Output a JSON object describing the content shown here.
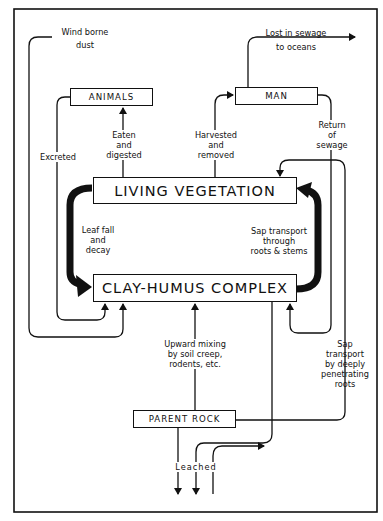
{
  "diagram": {
    "type": "nutrient-cycle flow diagram",
    "nodes": {
      "animals": "ANIMALS",
      "man": "MAN",
      "living_vegetation": "LIVING  VEGETATION",
      "clay_humus": "CLAY-HUMUS  COMPLEX",
      "parent_rock": "PARENT  ROCK"
    },
    "labels": {
      "wind": "Wind borne\ndust",
      "sewage_lost": "Lost in sewage\nto oceans",
      "excreted": "Excreted",
      "eaten": "Eaten\nand\ndigested",
      "harvested": "Harvested\nand\nremoved",
      "return_sewage": "Return\nof\nsewage",
      "leaf_fall": "Leaf fall\nand\ndecay",
      "sap_transport": "Sap transport\nthrough\nroots & stems",
      "upward_mixing": "Upward mixing\nby soil creep,\nrodents, etc.",
      "deep_sap": "Sap\ntransport\nby deeply\npenetrating\nroots",
      "leached": "Leached"
    },
    "edges": [
      {
        "from": "wind borne dust",
        "to": "CLAY-HUMUS COMPLEX"
      },
      {
        "from": "ANIMALS",
        "to": "CLAY-HUMUS COMPLEX",
        "label": "Excreted"
      },
      {
        "from": "LIVING VEGETATION",
        "to": "ANIMALS",
        "label": "Eaten and digested"
      },
      {
        "from": "LIVING VEGETATION",
        "to": "MAN",
        "label": "Harvested and removed"
      },
      {
        "from": "MAN",
        "to": "oceans",
        "label": "Lost in sewage to oceans"
      },
      {
        "from": "MAN",
        "to": "CLAY-HUMUS COMPLEX",
        "label": "Return of sewage"
      },
      {
        "from": "LIVING VEGETATION",
        "to": "CLAY-HUMUS COMPLEX",
        "label": "Leaf fall and decay"
      },
      {
        "from": "CLAY-HUMUS COMPLEX",
        "to": "LIVING VEGETATION",
        "label": "Sap transport through roots & stems"
      },
      {
        "from": "PARENT ROCK",
        "to": "CLAY-HUMUS COMPLEX",
        "label": "Upward mixing by soil creep, rodents, etc."
      },
      {
        "from": "PARENT ROCK",
        "to": "LIVING VEGETATION",
        "label": "Sap transport by deeply penetrating roots"
      },
      {
        "from": "PARENT ROCK / CLAY-HUMUS COMPLEX",
        "to": "below",
        "label": "Leached"
      }
    ],
    "colors": {
      "ink": "#111111",
      "background": "#ffffff"
    }
  }
}
